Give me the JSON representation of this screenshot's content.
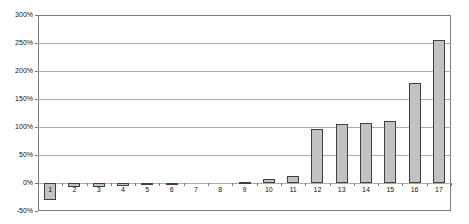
{
  "chart_data": {
    "type": "bar",
    "title": "",
    "xlabel": "",
    "ylabel": "",
    "categories": [
      "1",
      "2",
      "3",
      "4",
      "5",
      "6",
      "7",
      "8",
      "9",
      "10",
      "11",
      "12",
      "13",
      "14",
      "15",
      "16",
      "17"
    ],
    "values": [
      -30,
      -7,
      -7,
      -6,
      -2,
      -1,
      0,
      0,
      2,
      8,
      13,
      97,
      105,
      107,
      110,
      178,
      255
    ],
    "ylim": [
      -50,
      300
    ],
    "yticks": [
      300,
      250,
      200,
      150,
      100,
      50,
      0,
      -50
    ],
    "ytick_labels": [
      "300%",
      "250%",
      "200%",
      "150%",
      "100%",
      "50%",
      "0%",
      "-50%"
    ],
    "grid": true,
    "legend": "none",
    "bar_width_px": 12,
    "colors": {
      "bar_fill": "#c2c2c2",
      "bar_border": "#404040",
      "gridline": "#ababab",
      "plot_border": "#7d7d7d",
      "tick": "#7d7d7d",
      "text": "#111111",
      "background": "#ffffff"
    }
  }
}
